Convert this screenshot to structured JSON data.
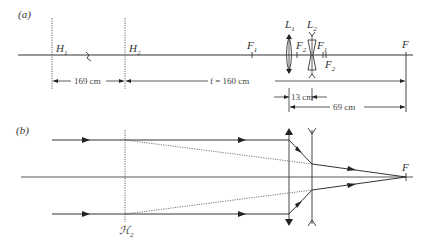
{
  "panel_a": {
    "label": "(a)",
    "planes": {
      "h1": "H",
      "h1_sub": "1",
      "h2": "H",
      "h2_sub": "2"
    },
    "lenses": {
      "l1": "L",
      "l1_sub": "1",
      "l2": "L",
      "l2_sub": "2"
    },
    "foci": {
      "f1_left": "F",
      "f1_left_sub": "1",
      "f2_left": "F",
      "f2_left_sub": "2",
      "f1_right": "F",
      "f1_right_sub": "1",
      "f2_right": "F",
      "f2_right_sub": "2",
      "system_focus": "F"
    },
    "dimensions": {
      "h1_h2": "169 cm",
      "focal_length": "f = 160 cm",
      "lens_separation": "13 cm",
      "l1_to_focus": "69 cm"
    }
  },
  "panel_b": {
    "label": "(b)",
    "principal_plane": "ℋ",
    "principal_plane_sub": "2",
    "focus": "F"
  },
  "colors": {
    "line": "#333333",
    "dashed": "#555555",
    "background": "#ffffff"
  }
}
